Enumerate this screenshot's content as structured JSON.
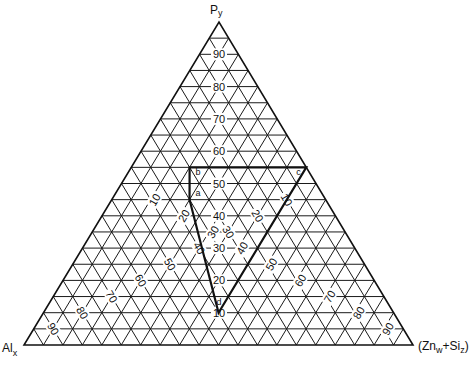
{
  "diagram": {
    "type": "ternary",
    "vertices": {
      "top": {
        "label": "Py",
        "main": "P",
        "sub": "y"
      },
      "left": {
        "label": "Alx",
        "main": "Al",
        "sub": "x"
      },
      "right": {
        "label": "(Znw+Siz)",
        "pre": "(Zn",
        "sub1": "w",
        "mid": "+Si",
        "sub2": "z",
        "post": ")"
      }
    },
    "grid_divisions": 20,
    "axis_labels": {
      "py": [
        "10",
        "20",
        "30",
        "40",
        "50",
        "60",
        "70",
        "80",
        "90"
      ],
      "al": [
        "10",
        "20",
        "30",
        "40",
        "50",
        "60",
        "70",
        "80",
        "90"
      ],
      "znsi": [
        "10",
        "20",
        "30",
        "40",
        "50",
        "60",
        "70",
        "80",
        "90"
      ]
    },
    "region": {
      "points": [
        {
          "label": "a",
          "py": 45,
          "al": 35,
          "znsi": 20
        },
        {
          "label": "b",
          "py": 55,
          "al": 30,
          "znsi": 15
        },
        {
          "label": "c",
          "py": 55,
          "al": 0,
          "znsi": 45
        },
        {
          "label": "d",
          "py": 10,
          "al": 45,
          "znsi": 45
        }
      ]
    }
  }
}
